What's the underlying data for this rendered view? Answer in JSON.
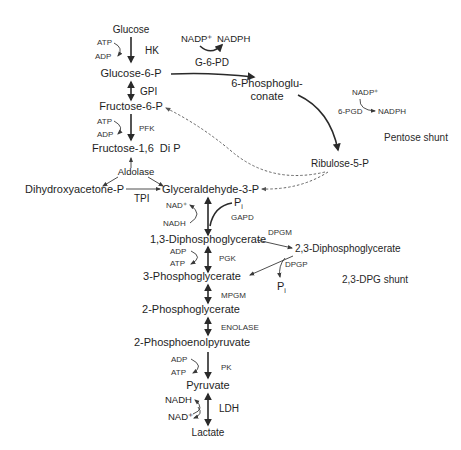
{
  "diagram": {
    "metabolites": {
      "glucose": "Glucose",
      "glucose6p": "Glucose-6-P",
      "fructose6p": "Fructose-6-P",
      "fructose16dip": "Fructose-1,6  Di P",
      "dhap": "Dihydroxyacetone-P",
      "g3p": "Glyceraldehyde-3-P",
      "bpg13": "1,3-Diphosphoglycerate",
      "bpg23": "2,3-Diphosphoglycerate",
      "pg3": "3-Phosphoglycerate",
      "pg2": "2-Phosphoglycerate",
      "pep": "2-Phosphoenolpyruvate",
      "pyruvate": "Pyruvate",
      "lactate": "Lactate",
      "phosphogluconate_line1": "6-Phosphoglu-",
      "phosphogluconate_line2": "conate",
      "ribulose5p": "Ribulose-5-P",
      "pi_gapd": "P",
      "pi_gapd_sub": "i",
      "pi_dpgp": "P",
      "pi_dpgp_sub": "i"
    },
    "enzymes": {
      "hk": "HK",
      "gpi": "GPI",
      "pfk": "PFK",
      "aldolase": "Aldolase",
      "tpi": "TPI",
      "gapd": "GAPD",
      "pgk": "PGK",
      "mpgm": "MPGM",
      "enolase": "ENOLASE",
      "pk": "PK",
      "ldh": "LDH",
      "g6pd": "G-6-PD",
      "pgd6": "6-PGD",
      "dpgm": "DPGM",
      "dpgp": "DPGP"
    },
    "cofactors": {
      "hk_in": "ATP",
      "hk_out": "ADP",
      "pfk_in": "ATP",
      "pfk_out": "ADP",
      "gapd_in": "NAD⁺",
      "gapd_out": "NADH",
      "pgk_in": "ADP",
      "pgk_out": "ATP",
      "pk_in": "ADP",
      "pk_out": "ATP",
      "ldh_top": "NADH",
      "ldh_bottom": "NAD⁺",
      "g6pd_in": "NADP⁺",
      "g6pd_out": "NADPH",
      "pgd6_in": "NADP⁺",
      "pgd6_out": "NADPH"
    },
    "labels": {
      "pentose_shunt": "Pentose shunt",
      "dpg_shunt": "2,3-DPG shunt"
    },
    "colors": {
      "ink": "#1e1e1e",
      "dashed": "#555555",
      "background": "#ffffff"
    }
  }
}
